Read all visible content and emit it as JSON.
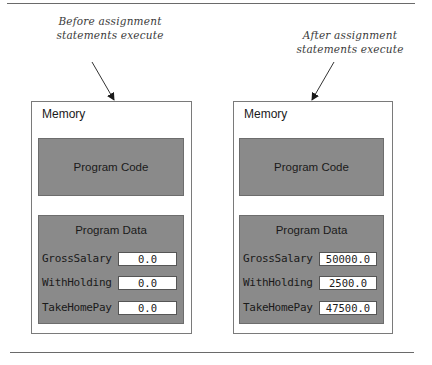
{
  "diagram": {
    "panels": [
      {
        "caption_line1": "Before assignment",
        "caption_line2": "statements execute",
        "memory_label": "Memory",
        "code_label": "Program Code",
        "data_label": "Program Data",
        "variables": [
          {
            "name": "GrossSalary",
            "value": "0.0"
          },
          {
            "name": "WithHolding",
            "value": "0.0"
          },
          {
            "name": "TakeHomePay",
            "value": "0.0"
          }
        ]
      },
      {
        "caption_line1": "After assignment",
        "caption_line2": "statements execute",
        "memory_label": "Memory",
        "code_label": "Program Code",
        "data_label": "Program Data",
        "variables": [
          {
            "name": "GrossSalary",
            "value": "50000.0"
          },
          {
            "name": "WithHolding",
            "value": "2500.0"
          },
          {
            "name": "TakeHomePay",
            "value": "47500.0"
          }
        ]
      }
    ]
  },
  "colors": {
    "box_fill": "#8a8a8a",
    "border": "#7a7a7a",
    "rule": "#6a6a6a"
  }
}
